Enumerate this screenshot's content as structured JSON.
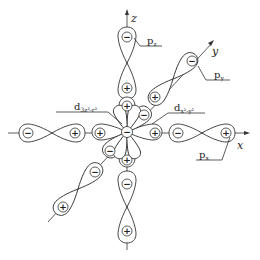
{
  "diagram": {
    "title": "",
    "colors": {
      "stroke": "#333333",
      "background": "#ffffff"
    },
    "axes": {
      "x": "x",
      "y": "y",
      "z": "z"
    },
    "orbital_labels": {
      "pz": {
        "main": "p",
        "sub": "z"
      },
      "py": {
        "main": "p",
        "sub": "y"
      },
      "px": {
        "main": "p",
        "sub": "x"
      },
      "dz2": {
        "main": "d",
        "sub": "3z²-r²"
      },
      "dx2y2": {
        "main": "d",
        "sub": "x²-y²"
      }
    },
    "signs": {
      "plus": "+",
      "minus": "−"
    }
  }
}
